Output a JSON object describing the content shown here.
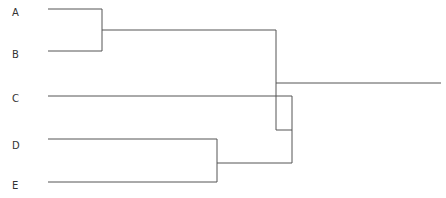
{
  "diagram": {
    "type": "dendrogram",
    "leaves": [
      {
        "label": "A",
        "y": 14
      },
      {
        "label": "B",
        "y": 56
      },
      {
        "label": "C",
        "y": 100
      },
      {
        "label": "D",
        "y": 147
      },
      {
        "label": "E",
        "y": 187
      }
    ],
    "line_color": "#555555"
  }
}
